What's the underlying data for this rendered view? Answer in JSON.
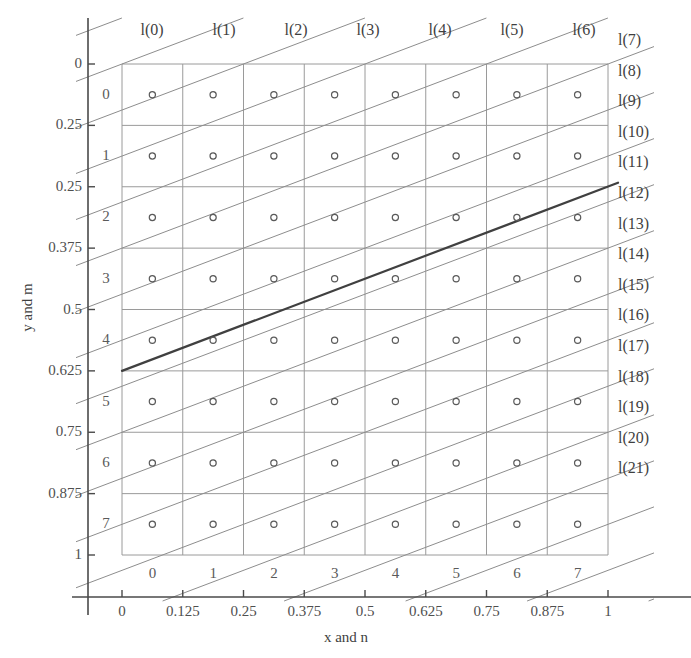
{
  "figure": {
    "axis_titles": {
      "x": "x and n",
      "y": "y and m"
    },
    "x_axis": {
      "tick_values": [
        "0",
        "0.125",
        "0.25",
        "0.375",
        "0.5",
        "0.625",
        "0.75",
        "0.875",
        "1"
      ],
      "cell_indices": [
        "0",
        "1",
        "2",
        "3",
        "4",
        "5",
        "6",
        "7"
      ]
    },
    "y_axis": {
      "tick_values": [
        "0",
        "0.25",
        "0.25",
        "0.375",
        "0.5",
        "0.625",
        "0.75",
        "0.875",
        "1"
      ],
      "cell_indices": [
        "0",
        "1",
        "2",
        "3",
        "4",
        "5",
        "6",
        "7"
      ]
    },
    "scan_lines_top": [
      "l(0)",
      "l(1)",
      "l(2)",
      "l(3)",
      "l(4)",
      "l(5)",
      "l(6)"
    ],
    "scan_lines_right": [
      "l(7)",
      "l(8)",
      "l(9)",
      "l(10)",
      "l(11)",
      "l(12)",
      "l(13)",
      "l(14)",
      "l(15)",
      "l(16)",
      "l(17)",
      "l(18)",
      "l(19)",
      "l(20)",
      "l(21)"
    ]
  },
  "chart_data": {
    "type": "scatter",
    "title": "",
    "xlabel": "x and n",
    "ylabel": "y and m",
    "xlim": [
      0,
      1
    ],
    "ylim": [
      1,
      0
    ],
    "grid": true,
    "legend": "none",
    "grid_size": {
      "columns": 8,
      "rows": 8
    },
    "pixel_centers_x": [
      0.0625,
      0.1875,
      0.3125,
      0.4375,
      0.5625,
      0.6875,
      0.8125,
      0.9375
    ],
    "pixel_centers_y": [
      0.0625,
      0.1875,
      0.3125,
      0.4375,
      0.5625,
      0.6875,
      0.8125,
      0.9375
    ],
    "marker": "open-circle",
    "bold_line": {
      "x": [
        0,
        1
      ],
      "y": [
        0.625,
        0.25
      ],
      "slope": -0.375,
      "intercept": 0.625
    },
    "scan_line_slope": -0.375,
    "scan_line_count": 22,
    "scan_line_labels": [
      "l(0)",
      "l(1)",
      "l(2)",
      "l(3)",
      "l(4)",
      "l(5)",
      "l(6)",
      "l(7)",
      "l(8)",
      "l(9)",
      "l(10)",
      "l(11)",
      "l(12)",
      "l(13)",
      "l(14)",
      "l(15)",
      "l(16)",
      "l(17)",
      "l(18)",
      "l(19)",
      "l(20)",
      "l(21)"
    ],
    "x_ticks": [
      0,
      0.125,
      0.25,
      0.375,
      0.5,
      0.625,
      0.75,
      0.875,
      1
    ],
    "x_ticklabels": [
      "0",
      "0.125",
      "0.25",
      "0.375",
      "0.5",
      "0.625",
      "0.75",
      "0.875",
      "1"
    ],
    "y_ticks": [
      0,
      0.25,
      0.25,
      0.375,
      0.5,
      0.625,
      0.75,
      0.875,
      1
    ],
    "y_ticklabels": [
      "0",
      "0.25",
      "0.25",
      "0.375",
      "0.5",
      "0.625",
      "0.75",
      "0.875",
      "1"
    ],
    "n_labels": [
      "0",
      "1",
      "2",
      "3",
      "4",
      "5",
      "6",
      "7"
    ],
    "m_labels": [
      "0",
      "1",
      "2",
      "3",
      "4",
      "5",
      "6",
      "7"
    ],
    "colors": {
      "grid": "#9a9a9a",
      "scan_line": "#8d8d8d",
      "bold_line": "#404040",
      "marker": "#5a5a5a",
      "axis": "#4a4a4a"
    }
  }
}
